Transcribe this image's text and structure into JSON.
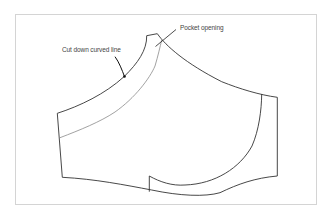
{
  "diagram": {
    "type": "sewing-pattern-piece",
    "labels": [
      {
        "id": "cut-down-curved-line",
        "text": "Cut down curved line"
      },
      {
        "id": "pocket-opening",
        "text": "Pocket opening"
      }
    ],
    "colors": {
      "outline": "#333333",
      "inner_guide_line": "#8a8a8a",
      "frame_border": "#d4d4d4",
      "label_text": "#444444",
      "background": "#ffffff"
    }
  }
}
